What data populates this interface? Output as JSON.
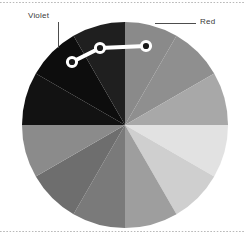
{
  "figure": {
    "kind": "color-wheel-pie",
    "background": "#ffffff",
    "rule_color": "#b9b9b9"
  },
  "annotations": {
    "violet": {
      "label": "Violet",
      "leader": "vertical"
    },
    "red": {
      "label": "Red",
      "leader": "horizontal"
    }
  },
  "overlay": {
    "name": "highlight-polyline",
    "stroke": "#ffffff",
    "marker_fill": "#1a1a1a",
    "points": [
      {
        "x": 72,
        "y": 62
      },
      {
        "x": 100,
        "y": 48
      },
      {
        "x": 146,
        "y": 46
      }
    ]
  },
  "chart_data": {
    "type": "pie",
    "title": "",
    "xlabel": "",
    "ylabel": "",
    "center": {
      "x": 125,
      "y": 125
    },
    "radius": 103,
    "start_angle_deg": -90,
    "legend": "none",
    "grid": false,
    "categories": [
      "Red",
      "Orange",
      "Yellow-Orange",
      "Yellow",
      "Yellow-Green",
      "Green",
      "Blue-Green",
      "Blue",
      "Blue-Violet",
      "Violet",
      "Red-Violet",
      "Red-Orange"
    ],
    "values": [
      30,
      30,
      30,
      30,
      30,
      30,
      30,
      30,
      30,
      30,
      30,
      30
    ],
    "colors": [
      "#8a8a8a",
      "#8f8f8f",
      "#a8a8a8",
      "#e2e2e2",
      "#cfcfcf",
      "#9e9e9e",
      "#7a7a7a",
      "#6e6e6e",
      "#8b8b8b",
      "#121212",
      "#0d0d0d",
      "#1f1f1f"
    ],
    "annotated_slices": [
      "Violet",
      "Red"
    ]
  }
}
